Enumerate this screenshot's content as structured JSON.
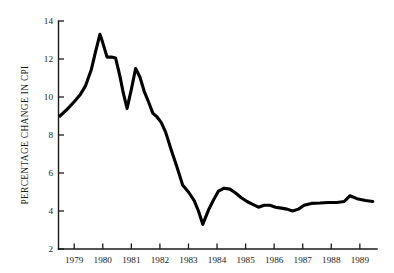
{
  "chart_data": {
    "type": "line",
    "title": "",
    "subtitle": "",
    "xlabel": "",
    "ylabel": "PERCENTAGE CHANGE IN CPI",
    "xlim": [
      1978.45,
      1989.6
    ],
    "ylim": [
      2,
      14
    ],
    "grid": false,
    "legend": false,
    "legend_position": "none",
    "x_tick_labels": [
      "1979",
      "1980",
      "1981",
      "1982",
      "1983",
      "1984",
      "1985",
      "1986",
      "1987",
      "1988",
      "1989"
    ],
    "x_ticks": [
      1979,
      1980,
      1981,
      1982,
      1983,
      1984,
      1985,
      1986,
      1987,
      1988,
      1989
    ],
    "y_tick_labels": [
      "2",
      "4",
      "6",
      "8",
      "10",
      "12",
      "14"
    ],
    "y_ticks": [
      2,
      4,
      6,
      8,
      10,
      12,
      14
    ],
    "series": [
      {
        "name": "Percentage change in CPI",
        "color": "#000000",
        "x": [
          1978.5,
          1978.75,
          1979.0,
          1979.2,
          1979.4,
          1979.6,
          1979.75,
          1979.9,
          1980.0,
          1980.15,
          1980.3,
          1980.45,
          1980.6,
          1980.72,
          1980.85,
          1981.0,
          1981.15,
          1981.3,
          1981.45,
          1981.6,
          1981.75,
          1981.9,
          1982.05,
          1982.2,
          1982.4,
          1982.6,
          1982.8,
          1983.0,
          1983.2,
          1983.35,
          1983.5,
          1983.7,
          1983.9,
          1984.05,
          1984.25,
          1984.45,
          1984.65,
          1984.85,
          1985.05,
          1985.25,
          1985.45,
          1985.65,
          1985.85,
          1986.05,
          1986.25,
          1986.45,
          1986.65,
          1986.85,
          1987.05,
          1987.3,
          1987.6,
          1987.9,
          1988.2,
          1988.45,
          1988.65,
          1988.9,
          1989.2,
          1989.45
        ],
        "y": [
          9.0,
          9.35,
          9.75,
          10.1,
          10.6,
          11.45,
          12.4,
          13.3,
          12.85,
          12.1,
          12.1,
          12.05,
          11.1,
          10.2,
          9.4,
          10.4,
          11.5,
          11.05,
          10.3,
          9.75,
          9.15,
          8.95,
          8.65,
          8.15,
          7.2,
          6.3,
          5.35,
          5.0,
          4.55,
          4.0,
          3.3,
          4.05,
          4.65,
          5.05,
          5.2,
          5.15,
          4.95,
          4.7,
          4.5,
          4.35,
          4.2,
          4.3,
          4.3,
          4.2,
          4.15,
          4.1,
          4.0,
          4.1,
          4.3,
          4.4,
          4.42,
          4.45,
          4.45,
          4.5,
          4.8,
          4.65,
          4.55,
          4.5
        ]
      }
    ]
  },
  "axes": {
    "y_axis_title": "PERCENTAGE CHANGE IN CPI"
  }
}
